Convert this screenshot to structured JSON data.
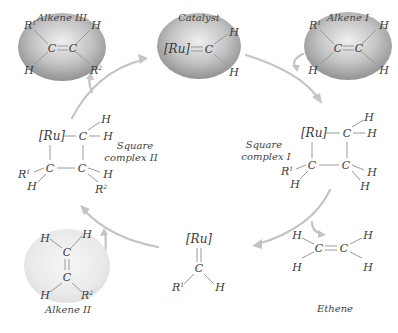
{
  "diagram": {
    "nodes": {
      "alkene3": {
        "label": "Alkene III",
        "atoms": {
          "c1": "C",
          "c2": "C",
          "tl": "R",
          "tl_sup": "1",
          "bl": "H",
          "tr": "H",
          "br": "R",
          "br_sup": "2"
        }
      },
      "catalyst": {
        "label": "Catalyst",
        "atoms": {
          "ru": "[Ru]",
          "c": "C",
          "tr": "H",
          "br": "H"
        }
      },
      "alkene1": {
        "label": "Alkene I",
        "atoms": {
          "c1": "C",
          "c2": "C",
          "tl": "R",
          "tl_sup": "1",
          "bl": "H",
          "tr": "H",
          "br": "H"
        }
      },
      "square1": {
        "label_line1": "Square",
        "label_line2": "complex I",
        "atoms": {
          "ru": "[Ru]",
          "c_tr": "C",
          "c_bl": "C",
          "c_br": "C",
          "h_top1": "H",
          "h_top2": "H",
          "r1": "R",
          "r1_sup": "1",
          "h_bl": "H",
          "h_br1": "H",
          "h_br2": "H"
        }
      },
      "square2": {
        "label_line1": "Square",
        "label_line2": "complex II",
        "atoms": {
          "ru": "[Ru]",
          "c_tr": "C",
          "c_bl": "C",
          "c_br": "C",
          "h_top1": "H",
          "h_top2": "H",
          "r1": "R",
          "r1_sup": "1",
          "h_bl": "H",
          "h_br": "H",
          "r2": "R",
          "r2_sup": "2"
        }
      },
      "carbene": {
        "atoms": {
          "ru": "[Ru]",
          "c": "C",
          "r1": "R",
          "r1_sup": "1",
          "h": "H"
        }
      },
      "ethene": {
        "label": "Ethene",
        "atoms": {
          "c1": "C",
          "c2": "C",
          "h1": "H",
          "h2": "H",
          "h3": "H",
          "h4": "H"
        }
      },
      "alkene2": {
        "label": "Alkene II",
        "atoms": {
          "c1": "C",
          "c2": "C",
          "h_tl": "H",
          "h_tr": "H",
          "h_bl": "H",
          "r2": "R",
          "r2_sup": "2"
        }
      }
    },
    "edges": [
      {
        "from": "catalyst",
        "to": "square1",
        "reactant": "alkene1"
      },
      {
        "from": "square1",
        "to": "carbene",
        "product": "ethene"
      },
      {
        "from": "carbene",
        "to": "square2",
        "reactant": "alkene2"
      },
      {
        "from": "square2",
        "to": "catalyst",
        "product": "alkene3"
      }
    ],
    "colors": {
      "blob_dark": "#8c8c8c",
      "blob_light": "#e0e0e0",
      "arrow": "#c4c4c4",
      "bond": "#9a9a9a",
      "text": "#3a3a3a"
    }
  }
}
